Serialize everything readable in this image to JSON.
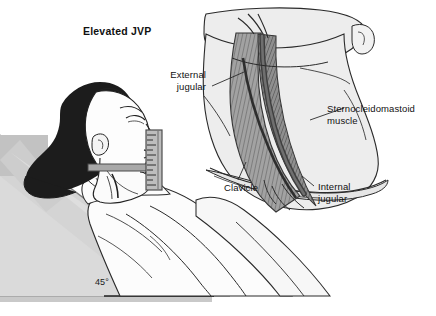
{
  "figure": {
    "title": "Elevated JVP",
    "domain_note": "medical illustration: jugular venous pressure assessment",
    "background_color": "#ffffff"
  },
  "labels": {
    "title": "Elevated JVP",
    "external_jugular": "External\njugular",
    "external_jugular_line1": "External",
    "external_jugular_line2": "jugular",
    "sternocleidomastoid": "Sternocleidomastoid\nmuscle",
    "sternocleidomastoid_line1": "Sternocleidomastoid",
    "sternocleidomastoid_line2": "muscle",
    "clavicle": "Clavicle",
    "internal_jugular_line1": "Internal",
    "internal_jugular_line2": "jugular",
    "angle": "45°"
  },
  "colors": {
    "ink": "#111111",
    "line": "#1a1a1a",
    "hair": "#1c1c1c",
    "skin_light": "#fbfbfb",
    "gown": "#fcfcfc",
    "bed_light": "#e8e8e8",
    "bed_mid": "#d8d8d8",
    "bed_dark": "#c9c9c9",
    "wedge_fill": "#d2d2d2",
    "neck_fill": "#ececed",
    "muscle_fill": "#9a9a9a",
    "muscle_dark": "#6e6e6e",
    "vein_fill": "#7d7d7d",
    "ruler_body": "#bdbdbd",
    "ruler_edge": "#555555",
    "shadow": "#cfcfcf"
  },
  "measurement_device": {
    "name": "ruler",
    "tick_count": 11,
    "orientation": "vertical",
    "crossbar": "horizontal level arm"
  },
  "anatomy_inset": {
    "structures": [
      "sternocleidomastoid muscle",
      "external jugular vein",
      "internal jugular vein",
      "clavicle"
    ]
  },
  "patient": {
    "posture": "semi-recumbent",
    "head_elevation_degrees": 45
  }
}
